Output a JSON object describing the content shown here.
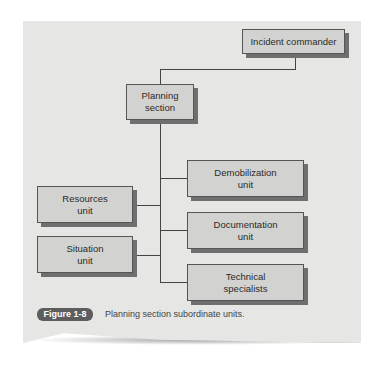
{
  "diagram": {
    "nodes": {
      "incident_commander": "Incident commander",
      "planning_section_line1": "Planning",
      "planning_section_line2": "section",
      "demobilization_line1": "Demobilization",
      "demobilization_line2": "unit",
      "resources_line1": "Resources",
      "resources_line2": "unit",
      "documentation_line1": "Documentation",
      "documentation_line2": "unit",
      "situation_line1": "Situation",
      "situation_line2": "unit",
      "technical_line1": "Technical",
      "technical_line2": "specialists"
    },
    "edges": [
      [
        "Incident commander",
        "Planning section"
      ],
      [
        "Planning section",
        "Demobilization unit"
      ],
      [
        "Planning section",
        "Resources unit"
      ],
      [
        "Planning section",
        "Documentation unit"
      ],
      [
        "Planning section",
        "Situation unit"
      ],
      [
        "Planning section",
        "Technical specialists"
      ]
    ]
  },
  "caption": {
    "label": "Figure 1-8",
    "text": "Planning section subordinate units."
  }
}
